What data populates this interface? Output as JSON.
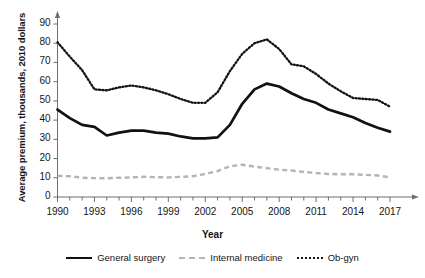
{
  "chart_data": {
    "type": "line",
    "title": "",
    "xlabel": "Year",
    "ylabel": "Average premium, thousands, 2010 dollars",
    "xlim": [
      1990,
      2017
    ],
    "ylim": [
      0,
      95
    ],
    "grid": false,
    "legend_position": "bottom",
    "x": [
      1990,
      1991,
      1992,
      1993,
      1994,
      1995,
      1996,
      1997,
      1998,
      1999,
      2000,
      2001,
      2002,
      2003,
      2004,
      2005,
      2006,
      2007,
      2008,
      2009,
      2010,
      2011,
      2012,
      2013,
      2014,
      2015,
      2016,
      2017
    ],
    "xtick_labels": [
      "1990",
      "1993",
      "1996",
      "1999",
      "2002",
      "2005",
      "2008",
      "2011",
      "2014",
      "2017"
    ],
    "xtick_values": [
      1990,
      1993,
      1996,
      1999,
      2002,
      2005,
      2008,
      2011,
      2014,
      2017
    ],
    "ytick_labels": [
      "0",
      "10",
      "20",
      "30",
      "40",
      "50",
      "60",
      "70",
      "80",
      "90"
    ],
    "ytick_values": [
      0,
      10,
      20,
      30,
      40,
      50,
      60,
      70,
      80,
      90
    ],
    "series": [
      {
        "name": "General surgery",
        "style": "solid",
        "color": "#111111",
        "values": [
          45.5,
          41.0,
          37.5,
          36.5,
          32.0,
          33.5,
          34.5,
          34.5,
          33.5,
          33.0,
          31.5,
          30.5,
          30.5,
          31.0,
          37.5,
          48.5,
          56.0,
          59.0,
          57.5,
          54.0,
          51.0,
          49.0,
          45.5,
          43.5,
          41.5,
          38.5,
          36.0,
          34.0
        ]
      },
      {
        "name": "Internal medicine",
        "style": "dashed",
        "color": "#b4b4b4",
        "values": [
          11.0,
          10.8,
          10.0,
          9.8,
          9.7,
          10.0,
          10.2,
          10.5,
          10.3,
          10.2,
          10.5,
          10.8,
          12.0,
          13.5,
          16.0,
          16.8,
          15.8,
          15.0,
          14.2,
          13.8,
          13.0,
          12.5,
          12.0,
          11.8,
          11.8,
          11.5,
          11.2,
          10.2
        ]
      },
      {
        "name": "Ob-gyn",
        "style": "dotted",
        "color": "#111111",
        "values": [
          80.5,
          73.0,
          66.0,
          56.0,
          55.5,
          57.0,
          58.0,
          57.0,
          55.5,
          53.5,
          51.0,
          49.0,
          49.0,
          54.5,
          65.5,
          74.5,
          80.0,
          82.0,
          77.0,
          69.0,
          68.0,
          64.0,
          59.0,
          55.0,
          51.5,
          51.0,
          50.5,
          47.0
        ]
      }
    ]
  },
  "axis": {
    "ylabel": "Average premium, thousands, 2010 dollars",
    "xlabel": "Year"
  },
  "legend": {
    "items": [
      {
        "label": "General surgery",
        "style": "solid"
      },
      {
        "label": "Internal medicine",
        "style": "dashed"
      },
      {
        "label": "Ob-gyn",
        "style": "dotted"
      }
    ]
  }
}
